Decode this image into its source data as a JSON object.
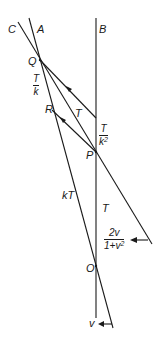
{
  "labels": {
    "C": "C",
    "A": "A",
    "B": "B",
    "Q": "Q",
    "R": "R",
    "P": "P",
    "O": "O",
    "T_mid": "T",
    "T_lower": "T",
    "kT": "kT",
    "v": "v"
  },
  "fractions": {
    "T_over_k": {
      "num": "T",
      "den": "k"
    },
    "T_over_k2": {
      "num": "T",
      "den": "k",
      "den_sup": "2"
    },
    "two_v": {
      "num": "2v",
      "den": "1+v",
      "den_sup": "2"
    }
  },
  "colors": {
    "stroke": "#1a1a1a",
    "background": "#ffffff"
  }
}
